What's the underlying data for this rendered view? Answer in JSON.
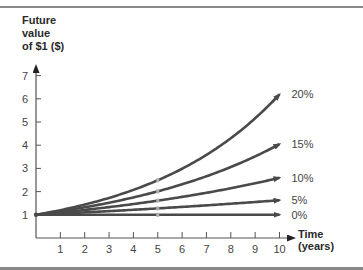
{
  "chart_data": {
    "type": "line",
    "title": "",
    "ylabel": "Future value of $1 ($)",
    "xlabel": "Time (years)",
    "x": [
      0,
      1,
      2,
      3,
      4,
      5,
      6,
      7,
      8,
      9,
      10
    ],
    "xlim": [
      0,
      10
    ],
    "ylim": [
      0,
      7
    ],
    "xticks": [
      "1",
      "2",
      "3",
      "4",
      "5",
      "6",
      "7",
      "8",
      "9",
      "10"
    ],
    "yticks": [
      "1",
      "2",
      "3",
      "4",
      "5",
      "6",
      "7"
    ],
    "grid": false,
    "legend": "inline labels at line ends",
    "series": [
      {
        "name": "20%",
        "values": [
          1,
          1.2,
          1.44,
          1.728,
          2.074,
          2.488,
          2.986,
          3.583,
          4.3,
          5.16,
          6.192
        ]
      },
      {
        "name": "15%",
        "values": [
          1,
          1.15,
          1.323,
          1.521,
          1.749,
          2.011,
          2.313,
          2.66,
          3.059,
          3.518,
          4.046
        ]
      },
      {
        "name": "10%",
        "values": [
          1,
          1.1,
          1.21,
          1.331,
          1.464,
          1.611,
          1.772,
          1.949,
          2.144,
          2.358,
          2.594
        ]
      },
      {
        "name": "5%",
        "values": [
          1,
          1.05,
          1.103,
          1.158,
          1.216,
          1.276,
          1.34,
          1.407,
          1.477,
          1.551,
          1.629
        ]
      },
      {
        "name": "0%",
        "values": [
          1,
          1,
          1,
          1,
          1,
          1,
          1,
          1,
          1,
          1,
          1
        ]
      }
    ]
  },
  "labels": {
    "y_axis": [
      "Future",
      "value",
      "of $1 ($)"
    ],
    "x_axis": [
      "Time",
      "(years)"
    ]
  },
  "colors": {
    "line": "#4a4a4a",
    "axis": "#555555",
    "rule": "#8a8a8a",
    "marker": "#b0b0b0"
  }
}
